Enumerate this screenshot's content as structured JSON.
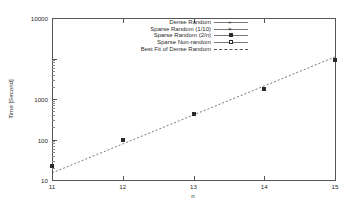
{
  "chart_data": {
    "type": "scatter",
    "title": "",
    "xlabel": "n",
    "ylabel": "Time [Second]",
    "xlim": [
      11,
      15
    ],
    "ylim": [
      10,
      10000
    ],
    "yscale": "log",
    "xscale": "linear",
    "grid": false,
    "legend_position": "top-center",
    "x_ticks": [
      "11",
      "12",
      "13",
      "14",
      "15"
    ],
    "y_ticks": [
      "10",
      "100",
      "1000",
      "10000"
    ],
    "series": [
      {
        "name": "Dense Random",
        "marker": "cross",
        "x": [
          11,
          12,
          13,
          14,
          15
        ],
        "values": [
          18,
          55,
          165,
          480,
          1700
        ]
      },
      {
        "name": "Sparse Random (1/10)",
        "marker": "x",
        "x": [
          11,
          12,
          13,
          14,
          15
        ],
        "values": [
          18,
          55,
          165,
          480,
          1700
        ]
      },
      {
        "name": "Sparse Random (2/n)",
        "marker": "filled-square",
        "x": [
          11,
          12,
          13,
          14,
          15
        ],
        "values": [
          18,
          55,
          165,
          480,
          1700
        ]
      },
      {
        "name": "Sparse Non-random",
        "marker": "open-square",
        "x": [
          11,
          12,
          13,
          14,
          15
        ],
        "values": [
          18,
          55,
          165,
          480,
          1700
        ]
      },
      {
        "name": "Best Fit of Dense Random",
        "marker": "none",
        "style": "dashed-line",
        "x": [
          11,
          15
        ],
        "values": [
          13.5,
          1900
        ]
      }
    ]
  },
  "axes": {
    "y_title": "Time [Second]",
    "x_title": "n",
    "y_tick_labels": [
      "10",
      "100",
      "1000",
      "10000"
    ],
    "x_tick_labels": [
      "11",
      "12",
      "13",
      "14",
      "15"
    ]
  },
  "legend": {
    "entries": [
      {
        "label": "Dense Random"
      },
      {
        "label": "Sparse Random (1/10)"
      },
      {
        "label": "Sparse Random (2/n)"
      },
      {
        "label": "Sparse Non-random"
      },
      {
        "label": "Best Fit of Dense Random"
      }
    ]
  },
  "colors": {
    "axis": "#555555",
    "text": "#2b2b2b",
    "marker": "#2b2b2b",
    "fit_line": "#555555",
    "background": "#ffffff"
  }
}
